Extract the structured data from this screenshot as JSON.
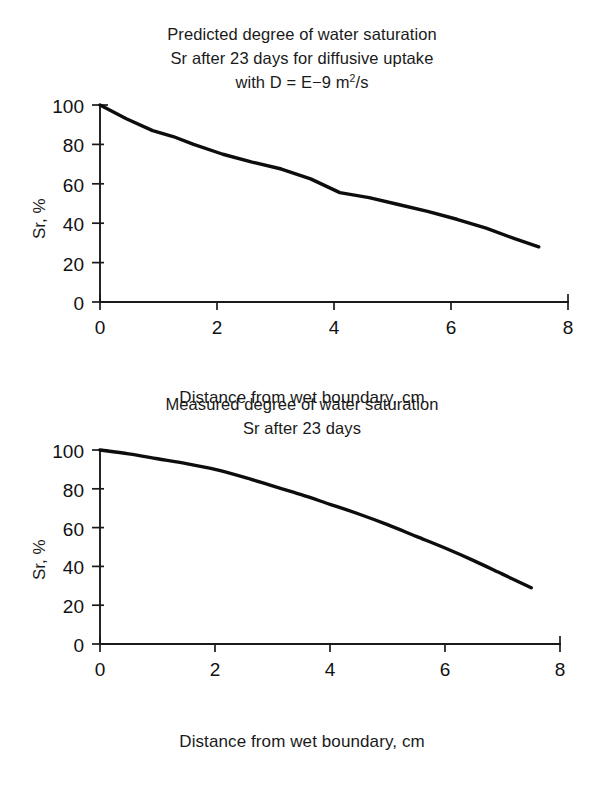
{
  "chart_data": [
    {
      "type": "line",
      "title": "Predicted degree of water saturation Sr after 23 days for diffusive uptake with D = E-9 m2/s",
      "title_lines": [
        "Predicted degree of water saturation",
        "Sr after 23 days for diffusive uptake",
        "with D = E−9 m"
      ],
      "title_line3_prefix": "with D = E−9 m",
      "title_line3_sup": "2",
      "title_line3_suffix": "/s",
      "xlabel": "Distance from wet boundary, cm",
      "ylabel": "Sr, %",
      "xlim": [
        0,
        8
      ],
      "ylim": [
        0,
        100
      ],
      "xticks": [
        0,
        2,
        4,
        6,
        8
      ],
      "yticks": [
        0,
        20,
        40,
        60,
        80,
        100
      ],
      "xticklabels": [
        "0",
        "2",
        "4",
        "6",
        "8"
      ],
      "yticklabels": [
        "0",
        "20",
        "40",
        "60",
        "80",
        "100"
      ],
      "grid": false,
      "legend": false,
      "series": [
        {
          "name": "Predicted Sr",
          "x": [
            0.0,
            0.45,
            0.9,
            1.25,
            1.6,
            2.1,
            2.6,
            3.1,
            3.6,
            4.1,
            4.6,
            5.1,
            5.6,
            6.1,
            6.6,
            7.1,
            7.5
          ],
          "y": [
            100.0,
            93.0,
            87.0,
            84.0,
            80.0,
            75.0,
            71.0,
            67.5,
            62.5,
            55.5,
            53.0,
            49.5,
            46.0,
            42.0,
            37.5,
            32.0,
            28.0
          ]
        }
      ]
    },
    {
      "type": "line",
      "title": "Measured degree of water saturation Sr after 23 days",
      "title_lines": [
        "Measured degree of water saturation",
        "Sr after 23 days"
      ],
      "xlabel": "Distance from wet boundary, cm",
      "ylabel": "Sr, %",
      "xlim": [
        0,
        8
      ],
      "ylim": [
        0,
        100
      ],
      "xticks": [
        0,
        2,
        4,
        6,
        8
      ],
      "yticks": [
        0,
        20,
        40,
        60,
        80,
        100
      ],
      "xticklabels": [
        "0",
        "2",
        "4",
        "6",
        "8"
      ],
      "yticklabels": [
        "0",
        "20",
        "40",
        "60",
        "80",
        "100"
      ],
      "grid": false,
      "legend": false,
      "series": [
        {
          "name": "Measured Sr",
          "x": [
            0.0,
            0.5,
            1.0,
            1.5,
            2.0,
            2.5,
            3.0,
            3.5,
            4.0,
            4.5,
            5.0,
            5.5,
            6.0,
            6.5,
            7.0,
            7.5
          ],
          "y": [
            100.0,
            98.0,
            95.5,
            93.0,
            90.0,
            86.0,
            81.5,
            77.0,
            72.0,
            67.0,
            61.5,
            55.5,
            49.5,
            43.0,
            36.0,
            29.0
          ]
        }
      ]
    }
  ],
  "figure_top": {
    "title_l1": "Predicted degree of water saturation",
    "title_l2": "Sr after 23 days for diffusive uptake",
    "title_l3a": "with D = E−9 m",
    "title_l3sup": "2",
    "title_l3b": "/s",
    "ylabel": "Sr, %",
    "xlabel": "Distance from wet boundary, cm",
    "yticks": [
      "100",
      "80",
      "60",
      "40",
      "20",
      "0"
    ],
    "xticks": [
      "0",
      "2",
      "4",
      "6",
      "8"
    ]
  },
  "figure_bottom": {
    "title_l1": "Measured degree of water saturation",
    "title_l2": "Sr after 23 days",
    "ylabel": "Sr, %",
    "xlabel": "Distance from wet boundary, cm",
    "yticks": [
      "100",
      "80",
      "60",
      "40",
      "20",
      "0"
    ],
    "xticks": [
      "0",
      "2",
      "4",
      "6",
      "8"
    ]
  }
}
